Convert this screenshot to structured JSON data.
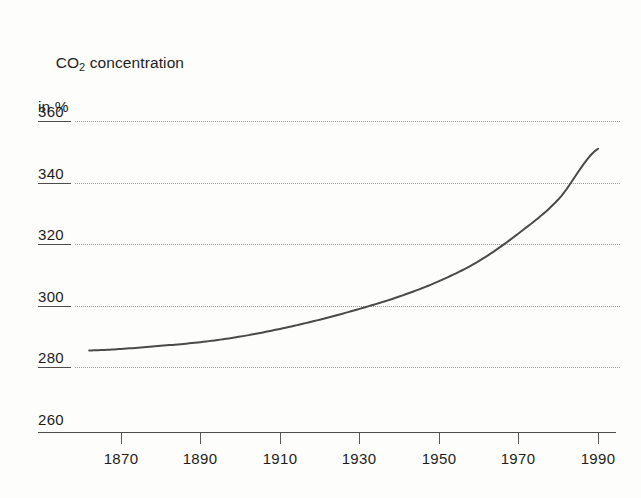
{
  "chart_data": {
    "type": "line",
    "title": "CO2 concentration in %",
    "title_line1_pre": "CO",
    "title_line1_sub": "2",
    "title_line1_post": " concentration",
    "title_line2": "in %",
    "xlabel": "",
    "ylabel": "CO2 concentration in %",
    "xlim": [
      1862,
      1992
    ],
    "ylim": [
      260,
      366
    ],
    "grid": true,
    "legend": "none",
    "x_ticks": [
      "1870",
      "1890",
      "1910",
      "1930",
      "1950",
      "1970",
      "1990"
    ],
    "y_ticks": [
      "260",
      "280",
      "300",
      "320",
      "340",
      "360"
    ],
    "series": [
      {
        "name": "CO2 concentration",
        "color": "#4a4a4a",
        "x": [
          1862,
          1870,
          1880,
          1890,
          1900,
          1910,
          1920,
          1930,
          1940,
          1950,
          1960,
          1970,
          1980,
          1990
        ],
        "values": [
          285.5,
          286.0,
          287.0,
          288.2,
          290.0,
          292.5,
          295.5,
          299.0,
          303.0,
          308.0,
          314.5,
          323.5,
          334.5,
          351.0
        ]
      }
    ],
    "annotations": []
  },
  "axis": {
    "y_tick_values": [
      360,
      340,
      320,
      300,
      280,
      260
    ],
    "x_tick_values": [
      1870,
      1890,
      1910,
      1930,
      1950,
      1970,
      1990
    ]
  },
  "colors": {
    "curve": "#4a4a4a",
    "axis": "#4d4d4d",
    "grid": "#9a9a9a",
    "text": "#1d1d1d",
    "background": "#fdfdfc"
  }
}
